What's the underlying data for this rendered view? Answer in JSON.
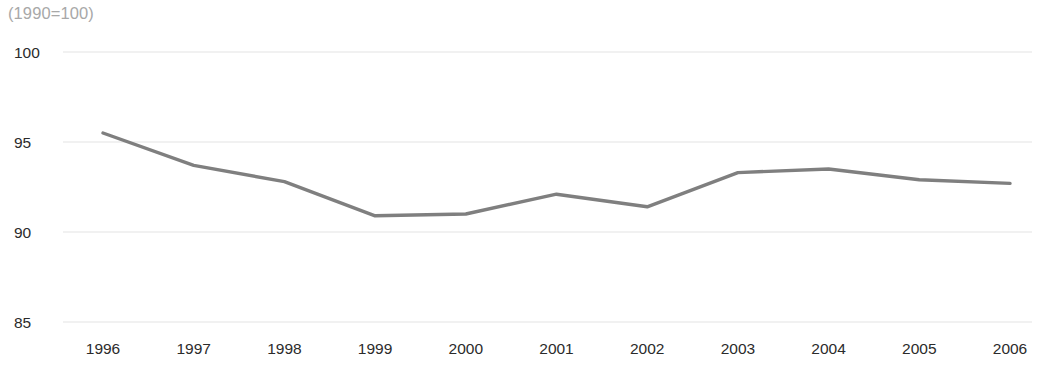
{
  "chart_data": {
    "type": "line",
    "title": "",
    "subtitle": "",
    "note": "(1990=100)",
    "xlabel": "",
    "ylabel": "",
    "categories": [
      "1996",
      "1997",
      "1998",
      "1999",
      "2000",
      "2001",
      "2002",
      "2003",
      "2004",
      "2005",
      "2006"
    ],
    "x": [
      1996,
      1997,
      1998,
      1999,
      2000,
      2001,
      2002,
      2003,
      2004,
      2005,
      2006
    ],
    "values": [
      95.5,
      93.7,
      92.8,
      90.9,
      91.0,
      92.1,
      91.4,
      93.3,
      93.5,
      92.9,
      92.7
    ],
    "series": [
      {
        "name": "index",
        "values": [
          95.5,
          93.7,
          92.8,
          90.9,
          91.0,
          92.1,
          91.4,
          93.3,
          93.5,
          92.9,
          92.7
        ],
        "color": "#7f7f7f"
      }
    ],
    "ylim": [
      85,
      100
    ],
    "yticks": [
      100,
      95,
      90,
      85
    ],
    "ytick_labels": [
      "100",
      "95",
      "90",
      "85"
    ],
    "xtick_labels": [
      "1996",
      "1997",
      "1998",
      "1999",
      "2000",
      "2001",
      "2002",
      "2003",
      "2004",
      "2005",
      "2006"
    ],
    "grid": true,
    "grid_axis": "y",
    "grid_color": "#ededed",
    "legend": false,
    "legend_position": "none",
    "line_color": "#7f7f7f",
    "line_width": 3.4,
    "background": "#ffffff",
    "text_color": "#2b2b2b",
    "note_color": "#a8a8a8"
  }
}
